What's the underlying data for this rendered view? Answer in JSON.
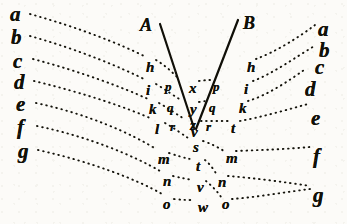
{
  "figure": {
    "width": 347,
    "height": 224,
    "ink_color": "#111109",
    "paper_color": "#fcfbf8"
  },
  "rays": {
    "line_a_label": "A",
    "line_b_label": "B"
  },
  "left_column": [
    {
      "label": "a",
      "x": 10,
      "y": 4
    },
    {
      "label": "b",
      "x": 11,
      "y": 27
    },
    {
      "label": "c",
      "x": 13,
      "y": 51
    },
    {
      "label": "d",
      "x": 14,
      "y": 72
    },
    {
      "label": "e",
      "x": 16,
      "y": 94
    },
    {
      "label": "f",
      "x": 17,
      "y": 117
    },
    {
      "label": "g",
      "x": 18,
      "y": 141
    }
  ],
  "right_column": [
    {
      "label": "a",
      "x": 318,
      "y": 19
    },
    {
      "label": "b",
      "x": 319,
      "y": 40
    },
    {
      "label": "c",
      "x": 315,
      "y": 57
    },
    {
      "label": "d",
      "x": 305,
      "y": 79
    },
    {
      "label": "e",
      "x": 311,
      "y": 108
    },
    {
      "label": "f",
      "x": 313,
      "y": 146
    },
    {
      "label": "g",
      "x": 313,
      "y": 185
    }
  ],
  "left_inner_column": [
    {
      "label": "h",
      "x": 146,
      "y": 60
    },
    {
      "label": "i",
      "x": 146,
      "y": 83
    },
    {
      "label": "k",
      "x": 149,
      "y": 102
    },
    {
      "label": "l",
      "x": 155,
      "y": 122
    },
    {
      "label": "m",
      "x": 158,
      "y": 152
    },
    {
      "label": "n",
      "x": 163,
      "y": 174
    },
    {
      "label": "o",
      "x": 163,
      "y": 197
    }
  ],
  "left_mid_column": [
    {
      "label": "p",
      "x": 165,
      "y": 80
    },
    {
      "label": "q",
      "x": 167,
      "y": 101
    },
    {
      "label": "r",
      "x": 170,
      "y": 120
    }
  ],
  "center_column": [
    {
      "label": "x",
      "x": 189,
      "y": 81
    },
    {
      "label": "y",
      "x": 190,
      "y": 102
    },
    {
      "label": "z",
      "x": 190,
      "y": 118
    },
    {
      "label": "v",
      "x": 191,
      "y": 125
    },
    {
      "label": "s",
      "x": 193,
      "y": 140
    },
    {
      "label": "t",
      "x": 196,
      "y": 159
    },
    {
      "label": "v",
      "x": 197,
      "y": 180
    },
    {
      "label": "w",
      "x": 198,
      "y": 200
    }
  ],
  "right_mid_column": [
    {
      "label": "p",
      "x": 213,
      "y": 80
    },
    {
      "label": "q",
      "x": 209,
      "y": 101
    },
    {
      "label": "r",
      "x": 206,
      "y": 120
    }
  ],
  "right_inner_column": [
    {
      "label": "h",
      "x": 247,
      "y": 60
    },
    {
      "label": "i",
      "x": 244,
      "y": 82
    },
    {
      "label": "k",
      "x": 239,
      "y": 101
    },
    {
      "label": "t",
      "x": 231,
      "y": 121
    },
    {
      "label": "m",
      "x": 226,
      "y": 151
    },
    {
      "label": "n",
      "x": 218,
      "y": 175
    },
    {
      "label": "o",
      "x": 222,
      "y": 197
    }
  ],
  "ray_lines": [
    {
      "name": "ray-A",
      "x1": 160,
      "y1": 24,
      "x2": 194,
      "y2": 128
    },
    {
      "name": "ray-B",
      "x1": 238,
      "y1": 20,
      "x2": 196,
      "y2": 129
    }
  ],
  "dotted_paths": {
    "left_side": [
      "M 30,14 C 80,28 120,44 146,57",
      "M 30,36 C 80,50 122,68 146,80",
      "M 33,59 C 82,72 124,88 148,99",
      "M 34,81 C 84,93 128,108 152,119",
      "M 36,103 C 88,114 132,134 156,149",
      "M 37,126 C 90,137 134,156 160,171",
      "M 38,150 C 92,162 138,180 162,194"
    ],
    "left_inner": [
      "M 156,60 C 166,66 172,72 179,79",
      "M 156,84 C 166,90 174,96 181,100",
      "M 159,103 C 168,108 176,114 183,118",
      "M 165,123 C 174,128 182,134 188,138",
      "M 169,153 C 178,156 185,158 190,159",
      "M 173,176 C 181,178 188,179 192,180",
      "M 174,199 C 182,200 189,200 193,200"
    ],
    "center_right": [
      "M 199,81 C 206,80 210,80 211,80",
      "M 199,102 C 204,101 207,101 208,101",
      "M 201,121 C 209,121 217,121 228,121",
      "M 203,141 C 212,144 219,148 224,151",
      "M 205,160 C 210,164 214,170 217,175",
      "M 206,181 C 212,186 218,192 221,197"
    ],
    "right_inner": [
      "M 256,59 C 275,52 298,38 315,25",
      "M 253,81 C 272,74 296,57 316,45",
      "M 248,101 C 268,95 290,80 304,70",
      "M 240,121 C 262,117 286,110 308,104",
      "M 236,151 C 262,150 288,149 310,147",
      "M 228,176 C 254,178 284,182 310,186",
      "M 232,199 C 258,197 286,192 310,189"
    ]
  }
}
